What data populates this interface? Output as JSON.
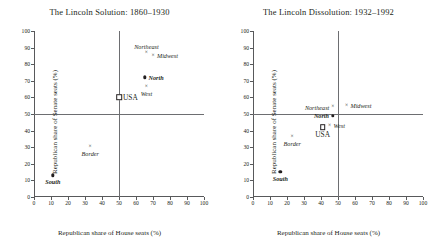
{
  "figure": {
    "panels": [
      {
        "id": "left",
        "title": "The Lincoln Solution: 1860–1930",
        "xlabel": "Republican share of House seats (%)",
        "ylabel": "Republican share of Senate seats (%)"
      },
      {
        "id": "right",
        "title": "The Lincoln Dissolution: 1932–1992",
        "xlabel": "Republican share of House seats (%)",
        "ylabel": "Republican share of Senate seats (%)"
      }
    ],
    "ticks": {
      "x": [
        "0",
        "10",
        "20",
        "30",
        "40",
        "50",
        "60",
        "70",
        "80",
        "90",
        "100"
      ],
      "y": [
        "0",
        "10",
        "20",
        "30",
        "40",
        "50",
        "60",
        "70",
        "80",
        "90",
        "100"
      ]
    }
  },
  "chart_data": [
    {
      "type": "scatter",
      "title": "The Lincoln Solution: 1860–1930",
      "xlabel": "Republican share of House seats (%)",
      "ylabel": "Republican share of Senate seats (%)",
      "xlim": [
        0,
        100
      ],
      "ylim": [
        0,
        100
      ],
      "xticks": [
        0,
        10,
        20,
        30,
        40,
        50,
        60,
        70,
        80,
        90,
        100
      ],
      "yticks": [
        0,
        10,
        20,
        30,
        40,
        50,
        60,
        70,
        80,
        90,
        100
      ],
      "grid": false,
      "legend": "none",
      "reference_lines": {
        "horizontal": 50,
        "vertical": 50
      },
      "points": [
        {
          "label": "Northeast",
          "x": 66,
          "y": 87,
          "marker": "cross",
          "label_pos": "above"
        },
        {
          "label": "Midwest",
          "x": 70,
          "y": 85,
          "marker": "cross",
          "label_pos": "right"
        },
        {
          "label": "North",
          "x": 65,
          "y": 72,
          "marker": "dot",
          "label_pos": "right"
        },
        {
          "label": "West",
          "x": 66,
          "y": 66,
          "marker": "cross",
          "label_pos": "below"
        },
        {
          "label": "USA",
          "x": 50,
          "y": 60,
          "marker": "square",
          "label_pos": "right"
        },
        {
          "label": "Border",
          "x": 33,
          "y": 30,
          "marker": "cross",
          "label_pos": "below"
        },
        {
          "label": "South",
          "x": 11,
          "y": 13,
          "marker": "dot",
          "label_pos": "below"
        }
      ]
    },
    {
      "type": "scatter",
      "title": "The Lincoln Dissolution: 1932–1992",
      "xlabel": "Republican share of House seats (%)",
      "ylabel": "Republican share of Senate seats (%)",
      "xlim": [
        0,
        100
      ],
      "ylim": [
        0,
        100
      ],
      "xticks": [
        0,
        10,
        20,
        30,
        40,
        50,
        60,
        70,
        80,
        90,
        100
      ],
      "yticks": [
        0,
        10,
        20,
        30,
        40,
        50,
        60,
        70,
        80,
        90,
        100
      ],
      "grid": false,
      "legend": "none",
      "reference_lines": {
        "horizontal": 50,
        "vertical": 50
      },
      "points": [
        {
          "label": "Northeast",
          "x": 47,
          "y": 54,
          "marker": "cross",
          "label_pos": "left"
        },
        {
          "label": "Midwest",
          "x": 55,
          "y": 55,
          "marker": "cross",
          "label_pos": "right"
        },
        {
          "label": "North",
          "x": 47,
          "y": 49,
          "marker": "dot",
          "label_pos": "left"
        },
        {
          "label": "West",
          "x": 45,
          "y": 43,
          "marker": "cross",
          "label_pos": "right"
        },
        {
          "label": "USA",
          "x": 41,
          "y": 42,
          "marker": "square",
          "label_pos": "below"
        },
        {
          "label": "Border",
          "x": 23,
          "y": 36,
          "marker": "cross",
          "label_pos": "below"
        },
        {
          "label": "South",
          "x": 16,
          "y": 15,
          "marker": "dot",
          "label_pos": "below"
        }
      ]
    }
  ],
  "colors": {
    "axis": "#58595b",
    "reference": "#6d6e71",
    "marker": "#231f20",
    "background": "#ffffff"
  }
}
